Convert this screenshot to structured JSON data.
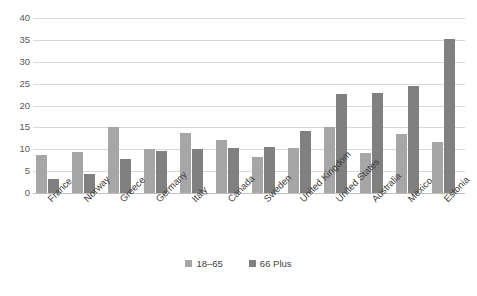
{
  "chart_data": {
    "type": "bar",
    "title": "",
    "subtitle": "",
    "xlabel": "",
    "ylabel": "",
    "ylim": [
      0,
      40
    ],
    "yticks": [
      0,
      5,
      10,
      15,
      20,
      25,
      30,
      35,
      40
    ],
    "grid": true,
    "legend_position": "bottom",
    "categories": [
      "France",
      "Norway",
      "Greece",
      "Germany",
      "Italy",
      "Canada",
      "Sweden",
      "United Kingdom",
      "United States",
      "Australia",
      "Mexico",
      "Estonia"
    ],
    "series": [
      {
        "name": "18–65",
        "color": "#a6a6a6",
        "values": [
          8.6,
          9.3,
          15.2,
          10.1,
          13.7,
          12.2,
          8.3,
          10.2,
          15.2,
          9.2,
          13.5,
          11.6
        ]
      },
      {
        "name": "66 Plus",
        "color": "#808080",
        "values": [
          3.3,
          4.4,
          7.7,
          9.6,
          10.1,
          10.3,
          10.6,
          14.2,
          22.6,
          22.9,
          24.4,
          35.3
        ]
      }
    ]
  },
  "axis": {
    "tick_labels": [
      "0",
      "5",
      "10",
      "15",
      "20",
      "25",
      "30",
      "35",
      "40"
    ]
  },
  "legend": {
    "items": [
      {
        "label": "18–65",
        "color": "#a6a6a6"
      },
      {
        "label": "66 Plus",
        "color": "#808080"
      }
    ]
  },
  "colors": {
    "series_18_65": "#a6a6a6",
    "series_66_plus": "#808080",
    "gridline": "#d9d9d9",
    "baseline": "#bfbfbf",
    "tick_text": "#595959",
    "label_text": "#404040",
    "background": "#ffffff"
  }
}
